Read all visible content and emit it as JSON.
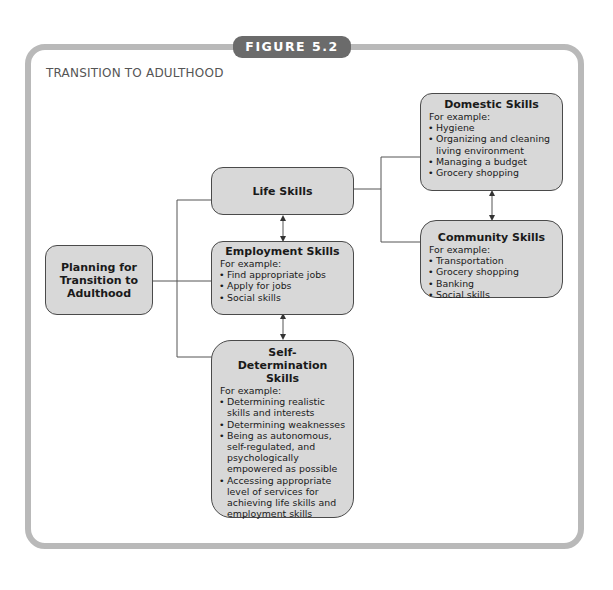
{
  "figure_label": "FIGURE 5.2",
  "title": "TRANSITION TO ADULTHOOD",
  "colors": {
    "frame": "#b9b9b9",
    "tab": "#6b6b6b",
    "box_fill": "#d8d8d8",
    "box_border": "#4a4a4a",
    "line": "#555555"
  },
  "nodes": {
    "planning": {
      "label": "Planning for Transition to Adulthood"
    },
    "life_skills": {
      "label": "Life Skills"
    },
    "employment": {
      "label": "Employment Skills",
      "intro": "For example:",
      "items": [
        "Find appropriate jobs",
        "Apply for jobs",
        "Social skills"
      ]
    },
    "self_determination": {
      "label": "Self-Determination Skills",
      "intro": "For example:",
      "items": [
        "Determining realistic skills and interests",
        "Determining weaknesses",
        "Being as autonomous, self-regulated, and psychologically empowered as possible",
        "Accessing appropriate level of services for achieving life skills and employment skills"
      ]
    },
    "domestic": {
      "label": "Domestic Skills",
      "intro": "For example:",
      "items": [
        "Hygiene",
        "Organizing and cleaning living environment",
        "Managing a budget",
        "Grocery shopping"
      ]
    },
    "community": {
      "label": "Community Skills",
      "intro": "For example:",
      "items": [
        "Transportation",
        "Grocery shopping",
        "Banking",
        "Social skills"
      ]
    }
  },
  "edges": [
    {
      "from": "planning",
      "to": "life_skills",
      "type": "line"
    },
    {
      "from": "planning",
      "to": "employment",
      "type": "line"
    },
    {
      "from": "planning",
      "to": "self_determination",
      "type": "line"
    },
    {
      "from": "life_skills",
      "to": "employment",
      "type": "bidirectional-arrow"
    },
    {
      "from": "employment",
      "to": "self_determination",
      "type": "bidirectional-arrow"
    },
    {
      "from": "life_skills",
      "to": "domestic",
      "type": "line"
    },
    {
      "from": "life_skills",
      "to": "community",
      "type": "line"
    },
    {
      "from": "domestic",
      "to": "community",
      "type": "bidirectional-arrow"
    }
  ]
}
